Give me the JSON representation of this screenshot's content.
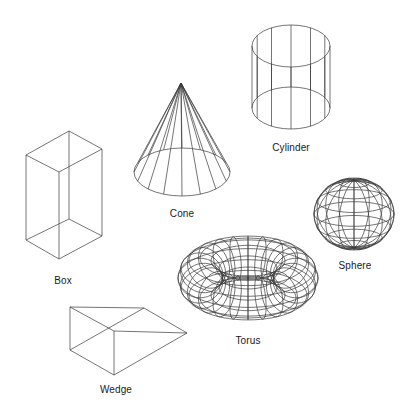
{
  "figure": {
    "background": "#ffffff",
    "stroke_color": "#333333",
    "shapes": [
      {
        "id": "box",
        "label": "Box",
        "label_pos": [
          63,
          275
        ]
      },
      {
        "id": "cone",
        "label": "Cone",
        "label_pos": [
          182,
          208
        ]
      },
      {
        "id": "cylinder",
        "label": "Cylinder",
        "label_pos": [
          291,
          142
        ]
      },
      {
        "id": "sphere",
        "label": "Sphere",
        "label_pos": [
          355,
          260
        ]
      },
      {
        "id": "torus",
        "label": "Torus",
        "label_pos": [
          248,
          335
        ]
      },
      {
        "id": "wedge",
        "label": "Wedge",
        "label_pos": [
          116,
          384
        ]
      }
    ]
  },
  "labels": {
    "box": "Box",
    "cone": "Cone",
    "cylinder": "Cylinder",
    "sphere": "Sphere",
    "torus": "Torus",
    "wedge": "Wedge"
  }
}
